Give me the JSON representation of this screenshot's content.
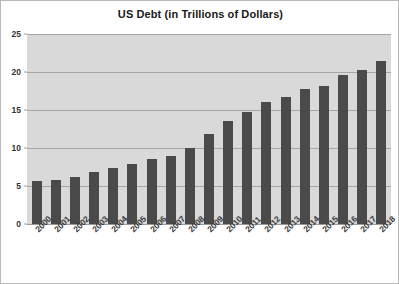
{
  "chart_data": {
    "type": "bar",
    "title": "US Debt (in Trillions of Dollars)",
    "xlabel": "",
    "ylabel": "",
    "ylim": [
      0,
      25
    ],
    "yticks": [
      0,
      5,
      10,
      15,
      20,
      25
    ],
    "grid": true,
    "legend": false,
    "bar_color": "#4a4a4a",
    "plot_background": "#d9d9d9",
    "gridline_color": "#a6a6a6",
    "categories": [
      "2000",
      "2001",
      "2002",
      "2003",
      "2004",
      "2005",
      "2006",
      "2007",
      "2008",
      "2009",
      "2010",
      "2011",
      "2012",
      "2013",
      "2014",
      "2015",
      "2016",
      "2017",
      "2018"
    ],
    "values": [
      5.7,
      5.8,
      6.2,
      6.8,
      7.4,
      7.9,
      8.5,
      9.0,
      10.0,
      11.9,
      13.6,
      14.8,
      16.1,
      16.7,
      17.8,
      18.2,
      19.6,
      20.2,
      21.5
    ]
  }
}
